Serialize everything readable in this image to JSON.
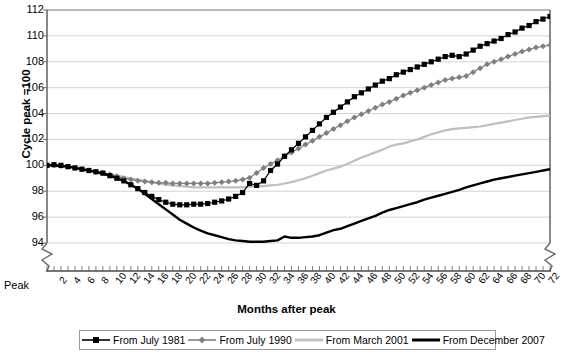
{
  "chart_data": {
    "type": "line",
    "title": "",
    "xlabel": "Months after peak",
    "ylabel": "Cycle peak =100",
    "xlim": [
      0,
      72
    ],
    "ylim": [
      94,
      112
    ],
    "yticks": [
      94,
      96,
      98,
      100,
      102,
      104,
      106,
      108,
      110,
      112
    ],
    "xticks": [
      2,
      4,
      6,
      8,
      10,
      12,
      14,
      16,
      18,
      20,
      22,
      24,
      26,
      28,
      30,
      32,
      34,
      36,
      38,
      40,
      42,
      44,
      46,
      48,
      50,
      52,
      54,
      56,
      58,
      60,
      62,
      64,
      66,
      68,
      70,
      72
    ],
    "x_origin_label": "Peak",
    "grid": true,
    "y_axis_break": true,
    "legend_position": "bottom",
    "x": [
      0,
      1,
      2,
      3,
      4,
      5,
      6,
      7,
      8,
      9,
      10,
      11,
      12,
      13,
      14,
      15,
      16,
      17,
      18,
      19,
      20,
      21,
      22,
      23,
      24,
      25,
      26,
      27,
      28,
      29,
      30,
      31,
      32,
      33,
      34,
      35,
      36,
      37,
      38,
      39,
      40,
      41,
      42,
      43,
      44,
      45,
      46,
      47,
      48,
      49,
      50,
      51,
      52,
      53,
      54,
      55,
      56,
      57,
      58,
      59,
      60,
      61,
      62,
      63,
      64,
      65,
      66,
      67,
      68,
      69,
      70,
      71,
      72
    ],
    "series": [
      {
        "name": "From July 1981",
        "color": "#000000",
        "marker": "square",
        "marker_color": "#000000",
        "line_width": 1.2,
        "values": [
          100.0,
          100.05,
          100.0,
          99.9,
          99.8,
          99.7,
          99.6,
          99.5,
          99.4,
          99.2,
          99.0,
          98.8,
          98.5,
          98.2,
          97.9,
          97.6,
          97.35,
          97.15,
          97.0,
          96.95,
          96.95,
          97.0,
          97.0,
          97.05,
          97.15,
          97.25,
          97.4,
          97.6,
          97.9,
          98.6,
          98.45,
          98.8,
          99.6,
          100.1,
          100.7,
          101.2,
          101.7,
          102.2,
          102.7,
          103.2,
          103.7,
          104.1,
          104.5,
          104.9,
          105.3,
          105.6,
          105.9,
          106.2,
          106.5,
          106.7,
          107.0,
          107.2,
          107.4,
          107.6,
          107.8,
          108.0,
          108.2,
          108.4,
          108.5,
          108.4,
          108.6,
          108.9,
          109.2,
          109.4,
          109.6,
          109.8,
          110.1,
          110.3,
          110.6,
          110.8,
          111.1,
          111.3,
          111.5
        ]
      },
      {
        "name": "From July 1990",
        "color": "#7f7f7f",
        "marker": "diamond",
        "marker_color": "#7f7f7f",
        "line_width": 1.2,
        "values": [
          100.0,
          100.0,
          99.95,
          99.9,
          99.8,
          99.7,
          99.6,
          99.5,
          99.4,
          99.3,
          99.15,
          99.0,
          98.9,
          98.8,
          98.75,
          98.7,
          98.65,
          98.65,
          98.6,
          98.6,
          98.6,
          98.6,
          98.6,
          98.6,
          98.65,
          98.7,
          98.75,
          98.8,
          98.9,
          99.05,
          99.4,
          99.8,
          100.1,
          100.4,
          100.7,
          101.0,
          101.3,
          101.6,
          101.9,
          102.2,
          102.5,
          102.8,
          103.1,
          103.4,
          103.7,
          103.95,
          104.2,
          104.45,
          104.7,
          104.9,
          105.15,
          105.4,
          105.6,
          105.8,
          106.0,
          106.2,
          106.4,
          106.6,
          106.7,
          106.8,
          106.9,
          107.2,
          107.5,
          107.8,
          108.0,
          108.2,
          108.4,
          108.6,
          108.8,
          108.95,
          109.1,
          109.2,
          109.3
        ]
      },
      {
        "name": "From March 2001",
        "color": "#bfbfbf",
        "marker": "none",
        "marker_color": "#bfbfbf",
        "line_width": 2.2,
        "values": [
          100.0,
          100.0,
          99.95,
          99.9,
          99.8,
          99.7,
          99.6,
          99.5,
          99.4,
          99.3,
          99.2,
          99.1,
          99.0,
          98.9,
          98.8,
          98.7,
          98.6,
          98.5,
          98.45,
          98.4,
          98.35,
          98.3,
          98.3,
          98.3,
          98.3,
          98.3,
          98.3,
          98.3,
          98.3,
          98.35,
          98.4,
          98.4,
          98.45,
          98.5,
          98.6,
          98.7,
          98.85,
          99.0,
          99.2,
          99.4,
          99.6,
          99.75,
          99.9,
          100.1,
          100.35,
          100.6,
          100.8,
          101.0,
          101.2,
          101.45,
          101.6,
          101.7,
          101.85,
          102.0,
          102.2,
          102.4,
          102.55,
          102.7,
          102.8,
          102.85,
          102.9,
          102.95,
          103.0,
          103.1,
          103.2,
          103.3,
          103.4,
          103.5,
          103.6,
          103.7,
          103.75,
          103.8,
          103.85
        ]
      },
      {
        "name": "From December 2007",
        "color": "#000000",
        "marker": "none",
        "marker_color": "#000000",
        "line_width": 2.4,
        "values": [
          100.0,
          100.0,
          99.95,
          99.9,
          99.8,
          99.7,
          99.6,
          99.5,
          99.35,
          99.2,
          99.0,
          98.8,
          98.5,
          98.2,
          97.8,
          97.4,
          97.0,
          96.6,
          96.2,
          95.8,
          95.5,
          95.2,
          94.95,
          94.75,
          94.6,
          94.45,
          94.3,
          94.2,
          94.15,
          94.1,
          94.1,
          94.1,
          94.15,
          94.2,
          94.5,
          94.4,
          94.4,
          94.45,
          94.5,
          94.6,
          94.8,
          95.0,
          95.1,
          95.3,
          95.5,
          95.7,
          95.9,
          96.1,
          96.35,
          96.55,
          96.7,
          96.85,
          97.0,
          97.15,
          97.35,
          97.5,
          97.65,
          97.8,
          97.95,
          98.1,
          98.3,
          98.45,
          98.6,
          98.75,
          98.9,
          99.0,
          99.1,
          99.2,
          99.3,
          99.4,
          99.5,
          99.6,
          99.7
        ]
      }
    ]
  }
}
